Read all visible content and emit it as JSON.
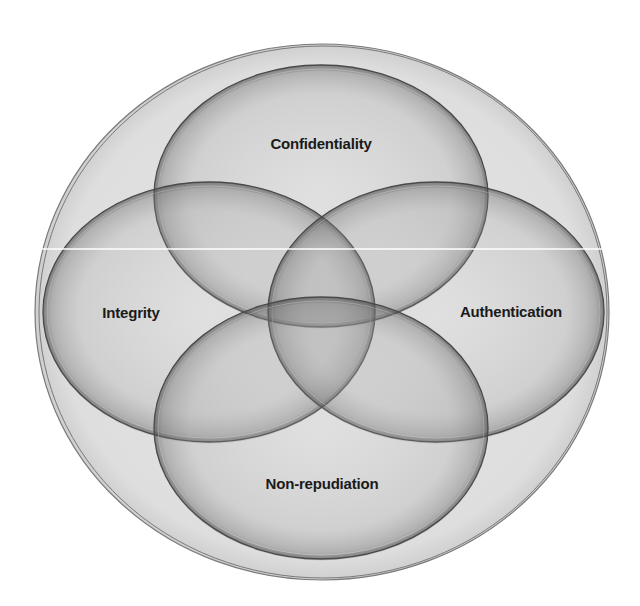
{
  "diagram": {
    "type": "venn",
    "background": "#ffffff",
    "outer": {
      "name": "security-boundary",
      "cx": 322,
      "cy": 312,
      "rx": 287,
      "ry": 268,
      "fill": "#e2e2e2",
      "stroke": "#7a7a7a"
    },
    "sets": [
      {
        "id": "confidentiality",
        "label": "Confidentiality",
        "cx": 321,
        "cy": 196,
        "rx": 167,
        "ry": 131,
        "label_x": 321,
        "label_y": 143
      },
      {
        "id": "integrity",
        "label": "Integrity",
        "cx": 209,
        "cy": 312,
        "rx": 166,
        "ry": 130,
        "label_x": 131,
        "label_y": 312
      },
      {
        "id": "authentication",
        "label": "Authentication",
        "cx": 436,
        "cy": 312,
        "rx": 168,
        "ry": 130,
        "label_x": 511,
        "label_y": 311
      },
      {
        "id": "non-repudiation",
        "label": "Non-repudiation",
        "cx": 321,
        "cy": 428,
        "rx": 167,
        "ry": 131,
        "label_x": 322,
        "label_y": 483
      }
    ],
    "set_fill": "#9a9a9a",
    "set_fill_opacity": 0.22,
    "set_stroke": "#4a4a4a",
    "artifact_line": {
      "y": 249,
      "x1": 40,
      "x2": 605,
      "color": "#ffffff"
    }
  }
}
